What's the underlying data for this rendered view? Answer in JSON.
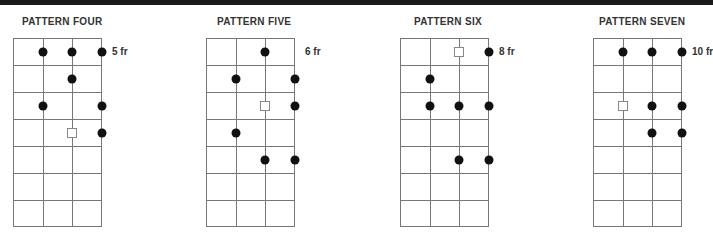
{
  "top_bar_color": "#1a1a1a",
  "patterns": [
    {
      "title": "PATTERN FOUR",
      "fret_label": "5 fr",
      "left": 13,
      "title_left": 22,
      "label_row": 1,
      "label_after_line": 3,
      "strings": 4,
      "frets": 7,
      "markers": [
        {
          "row": 1,
          "line": 1,
          "type": "dot"
        },
        {
          "row": 1,
          "line": 2,
          "type": "dot"
        },
        {
          "row": 1,
          "line": 3,
          "type": "dot"
        },
        {
          "row": 2,
          "line": 2,
          "type": "dot"
        },
        {
          "row": 3,
          "line": 1,
          "type": "dot"
        },
        {
          "row": 3,
          "line": 3,
          "type": "dot"
        },
        {
          "row": 4,
          "line": 2,
          "type": "root"
        },
        {
          "row": 4,
          "line": 3,
          "type": "dot"
        }
      ]
    },
    {
      "title": "PATTERN FIVE",
      "fret_label": "6 fr",
      "left": 206,
      "title_left": 217,
      "label_row": 1,
      "label_after_line": 3,
      "strings": 4,
      "frets": 7,
      "markers": [
        {
          "row": 1,
          "line": 2,
          "type": "dot"
        },
        {
          "row": 2,
          "line": 1,
          "type": "dot"
        },
        {
          "row": 2,
          "line": 3,
          "type": "dot"
        },
        {
          "row": 3,
          "line": 2,
          "type": "root"
        },
        {
          "row": 3,
          "line": 3,
          "type": "dot"
        },
        {
          "row": 4,
          "line": 1,
          "type": "dot"
        },
        {
          "row": 5,
          "line": 2,
          "type": "dot"
        },
        {
          "row": 5,
          "line": 3,
          "type": "dot"
        }
      ]
    },
    {
      "title": "PATTERN SIX",
      "fret_label": "8 fr",
      "left": 400,
      "title_left": 414,
      "label_row": 1,
      "label_after_line": 3,
      "strings": 4,
      "frets": 7,
      "markers": [
        {
          "row": 1,
          "line": 2,
          "type": "root"
        },
        {
          "row": 1,
          "line": 3,
          "type": "dot"
        },
        {
          "row": 2,
          "line": 1,
          "type": "dot"
        },
        {
          "row": 3,
          "line": 1,
          "type": "dot"
        },
        {
          "row": 3,
          "line": 2,
          "type": "dot"
        },
        {
          "row": 3,
          "line": 3,
          "type": "dot"
        },
        {
          "row": 5,
          "line": 2,
          "type": "dot"
        },
        {
          "row": 5,
          "line": 3,
          "type": "dot"
        }
      ]
    },
    {
      "title": "PATTERN SEVEN",
      "fret_label": "10 fr",
      "left": 593,
      "title_left": 599,
      "label_row": 1,
      "label_after_line": 3,
      "strings": 4,
      "frets": 7,
      "markers": [
        {
          "row": 1,
          "line": 1,
          "type": "dot"
        },
        {
          "row": 1,
          "line": 2,
          "type": "dot"
        },
        {
          "row": 1,
          "line": 3,
          "type": "dot"
        },
        {
          "row": 3,
          "line": 1,
          "type": "root"
        },
        {
          "row": 3,
          "line": 2,
          "type": "dot"
        },
        {
          "row": 3,
          "line": 3,
          "type": "dot"
        },
        {
          "row": 4,
          "line": 2,
          "type": "dot"
        },
        {
          "row": 4,
          "line": 3,
          "type": "dot"
        }
      ]
    }
  ]
}
